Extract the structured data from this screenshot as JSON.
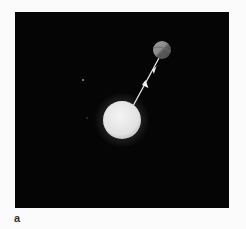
{
  "figure": {
    "panel_label": "a",
    "background_color": "#050505",
    "star": {
      "name": "star",
      "color": "#e8e8e8",
      "glow_color": "#ffffff",
      "cx": 107,
      "cy": 108,
      "r": 19
    },
    "planet": {
      "name": "planet",
      "color_light": "#9a9a9a",
      "color_dark": "#555555",
      "cx": 147,
      "cy": 38,
      "r": 9
    },
    "arrows": [
      {
        "name": "force-on-planet",
        "direction": "toward-star"
      },
      {
        "name": "force-on-star",
        "direction": "toward-planet"
      }
    ],
    "background_dots": [
      {
        "cx": 68,
        "cy": 68
      },
      {
        "cx": 72,
        "cy": 106
      }
    ]
  }
}
